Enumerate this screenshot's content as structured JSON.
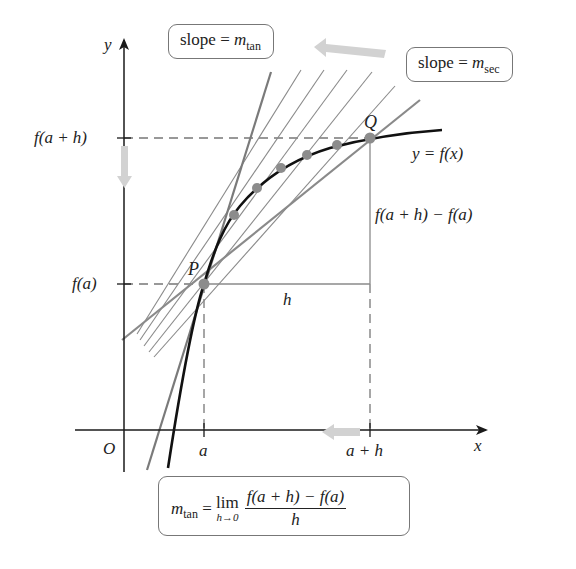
{
  "diagram": {
    "axes": {
      "x_label": "x",
      "y_label": "y",
      "origin_label": "O",
      "x_ticks": [
        "a",
        "a + h"
      ],
      "y_ticks": [
        "f(a + h)",
        "f(a)"
      ]
    },
    "points": {
      "P": "P",
      "Q": "Q"
    },
    "curve_label": "y = f(x)",
    "h_label": "h",
    "rise_label": "f(a + h) − f(a)",
    "callouts": {
      "tangent": {
        "prefix": "slope = ",
        "m": "m",
        "sub": "tan"
      },
      "secant": {
        "prefix": "slope = ",
        "m": "m",
        "sub": "sec"
      }
    },
    "formula": {
      "m": "m",
      "sub": "tan",
      "equals": " = ",
      "lim": "lim",
      "lim_under": "h→0",
      "numerator": "f(a + h) − f(a)",
      "denominator": "h"
    },
    "colors": {
      "axis": "#1a1a1a",
      "curve": "#111111",
      "secant": "#8a8a8a",
      "tangent": "#7a7a7a",
      "dashed": "#777777",
      "dot": "#8c8c8c",
      "arrow": "#cfcfcf"
    }
  }
}
